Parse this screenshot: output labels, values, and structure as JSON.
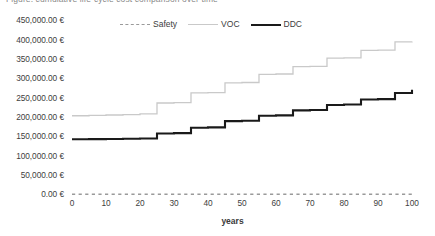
{
  "clipped_header_text": "Figure: cumulative life-cycle cost comparison over time",
  "axis_titles": {
    "x": "years",
    "y": ""
  },
  "legend": {
    "position": "top-center",
    "entries": [
      {
        "label": "Safety",
        "style": "dashed",
        "color": "#9a9a9a"
      },
      {
        "label": "VOC",
        "style": "solid",
        "color": "#c9c9c9"
      },
      {
        "label": "DDC",
        "style": "solid-bold",
        "color": "#1a1a1a"
      }
    ]
  },
  "y_tick_labels": [
    "450,000.00 €",
    "400,000.00 €",
    "350,000.00 €",
    "300,000.00 €",
    "250,000.00 €",
    "200,000.00 €",
    "150,000.00 €",
    "100,000.00 €",
    "50,000.00 €",
    "0.00 €"
  ],
  "x_tick_labels": [
    "0",
    "10",
    "20",
    "30",
    "40",
    "50",
    "60",
    "70",
    "80",
    "90",
    "100"
  ],
  "chart_data": {
    "type": "line",
    "title": "",
    "subtitle": "",
    "xlabel": "years",
    "ylabel": "",
    "xlim": [
      0,
      100
    ],
    "ylim": [
      0,
      450000
    ],
    "ytick_step": 50000,
    "xtick_step": 10,
    "grid": false,
    "legend_position": "top-center",
    "currency": "EUR",
    "step_shape": "post",
    "x": [
      0,
      5,
      10,
      15,
      20,
      25,
      30,
      35,
      40,
      45,
      50,
      55,
      60,
      65,
      70,
      75,
      80,
      85,
      90,
      95,
      100
    ],
    "series": [
      {
        "name": "Safety",
        "style": "dashed",
        "color": "#9a9a9a",
        "values": [
          0,
          0,
          0,
          0,
          0,
          0,
          0,
          0,
          0,
          0,
          0,
          0,
          0,
          0,
          0,
          0,
          0,
          0,
          0,
          0,
          0
        ]
      },
      {
        "name": "VOC",
        "style": "solid",
        "color": "#c9c9c9",
        "values": [
          203000,
          204000,
          205000,
          206000,
          208000,
          236000,
          237000,
          262000,
          263000,
          288000,
          289000,
          310000,
          311000,
          330000,
          331000,
          352000,
          353000,
          372000,
          373000,
          394000,
          395000
        ]
      },
      {
        "name": "DDC",
        "style": "solid-bold",
        "color": "#1a1a1a",
        "values": [
          142000,
          142500,
          143000,
          143500,
          144000,
          157000,
          158000,
          172000,
          173000,
          189000,
          190000,
          203000,
          204000,
          217000,
          218000,
          231000,
          232000,
          245000,
          246000,
          262000,
          270000
        ]
      }
    ]
  }
}
